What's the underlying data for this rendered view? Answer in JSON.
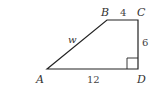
{
  "figure": {
    "type": "trapezoid",
    "vertices": {
      "A": {
        "label": "A"
      },
      "B": {
        "label": "B"
      },
      "C": {
        "label": "C"
      },
      "D": {
        "label": "D"
      }
    },
    "sides": {
      "AB": {
        "label": "w"
      },
      "BC": {
        "label": "4"
      },
      "CD": {
        "label": "6"
      },
      "AD": {
        "label": "12"
      }
    },
    "right_angle_at": "D",
    "stroke_color": "#222222"
  }
}
